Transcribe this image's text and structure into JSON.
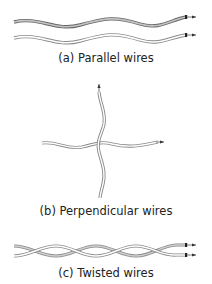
{
  "figure": {
    "panels": [
      {
        "id": "a",
        "caption": "(a) Parallel wires"
      },
      {
        "id": "b",
        "caption": "(b) Perpendicular wires"
      },
      {
        "id": "c",
        "caption": "(c) Twisted wires"
      }
    ],
    "colors": {
      "wire_outline": "#777777",
      "wire_fill_dark": "#bdbdbd",
      "wire_fill_light": "#ffffff",
      "terminal": "#222222"
    }
  }
}
